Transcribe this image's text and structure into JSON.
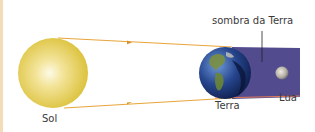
{
  "diagram": {
    "type": "lunar-eclipse",
    "labels": {
      "sun": "Sol",
      "earth": "Terra",
      "moon": "Lua",
      "shadow": "sombra da Terra"
    },
    "colors": {
      "sun": "#e6cc4a",
      "sun_core": "#fbf6d6",
      "rays": "#e8a53a",
      "shadow": "#4f4a8a",
      "shadow_edge": "#e07a5a",
      "earth_ocean": "#1f3f8a",
      "earth_land": "#6f8a3a",
      "moon": "#b8b4ac",
      "left_bar": "#f3dcb8"
    }
  }
}
